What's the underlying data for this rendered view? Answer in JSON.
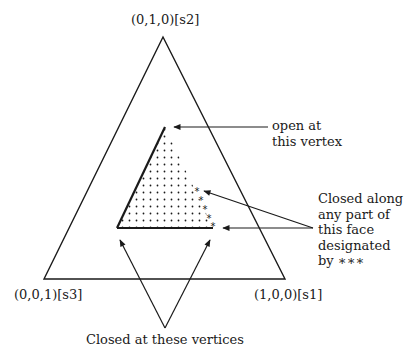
{
  "diagram": {
    "type": "simplex-triangle",
    "colors": {
      "line": "#1a1a1a",
      "background": "#ffffff"
    },
    "vertices": {
      "top": "(0,1,0)[s2]",
      "bottom_left": "(0,0,1)[s3]",
      "bottom_right": "(1,0,0)[s1]"
    },
    "annotations": {
      "open_vertex": [
        "open at",
        "this vertex"
      ],
      "closed_face": [
        "Closed along",
        "any part of",
        "this face",
        "designated",
        "by ∗∗∗"
      ],
      "closed_vertices": "Closed at these vertices"
    },
    "face_marker_symbol": "∗"
  }
}
